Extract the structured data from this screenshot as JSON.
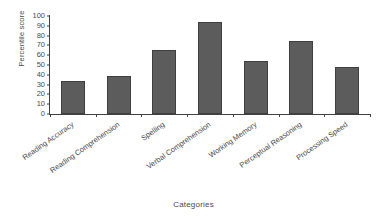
{
  "chart_data": {
    "type": "bar",
    "title": "",
    "xlabel": "Categories",
    "ylabel": "Percentile score",
    "categories": [
      "Reading Accuracy",
      "Reading Comprehension",
      "Spelling",
      "Verbal Comprehension",
      "Working Memory",
      "Perceptual Reasoning",
      "Processing Speed"
    ],
    "values": [
      34,
      39,
      65,
      94,
      54,
      75,
      48
    ],
    "ylim": [
      0,
      100
    ],
    "yticks": [
      0,
      10,
      20,
      30,
      40,
      50,
      60,
      70,
      80,
      90,
      100
    ],
    "ytick_labels": [
      "0",
      "10",
      "20",
      "30",
      "40",
      "50",
      "60",
      "70",
      "80",
      "90",
      "100"
    ],
    "grid": false,
    "legend": false,
    "bar_color": "#5c5c5c",
    "bar_edge_color": "#3f3f3f",
    "axis_color": "#404040",
    "background": "#ffffff"
  }
}
